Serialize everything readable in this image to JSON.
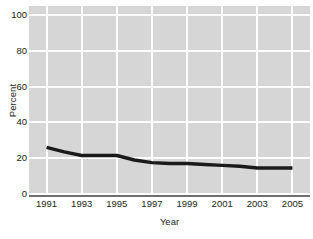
{
  "chart_data": {
    "type": "line",
    "title": "",
    "xlabel": "Year",
    "ylabel": "Percent",
    "x": [
      1991,
      1992,
      1993,
      1994,
      1995,
      1996,
      1997,
      1998,
      1999,
      2000,
      2001,
      2002,
      2003,
      2004,
      2005
    ],
    "values": [
      26,
      23.5,
      21.5,
      21.5,
      21.5,
      19,
      17.5,
      17,
      17,
      16.5,
      16,
      15.5,
      14.5,
      14.5,
      14.5
    ],
    "series": [
      {
        "name": "Percent",
        "values": [
          26,
          23.5,
          21.5,
          21.5,
          21.5,
          19,
          17.5,
          17,
          17,
          16.5,
          16,
          15.5,
          14.5,
          14.5,
          14.5
        ]
      }
    ],
    "xlim": [
      1990,
      2006
    ],
    "ylim": [
      0,
      105
    ],
    "x_ticks": [
      "1991",
      "1993",
      "1995",
      "1997",
      "1999",
      "2001",
      "2003",
      "2005"
    ],
    "x_tick_values": [
      1991,
      1993,
      1995,
      1997,
      1999,
      2001,
      2003,
      2005
    ],
    "y_ticks": [
      "100",
      "80",
      "60",
      "40",
      "20",
      "0"
    ],
    "y_tick_values": [
      100,
      80,
      60,
      40,
      20,
      0
    ],
    "grid": "both",
    "legend": "none",
    "colors": {
      "plot_background": "#d6d6d6",
      "gridline": "#ffffff",
      "line": "#1a1a1a",
      "axis": "#6f6f6f",
      "text": "#231f20",
      "page_background": "#ffffff"
    },
    "line_width": 3.4
  }
}
